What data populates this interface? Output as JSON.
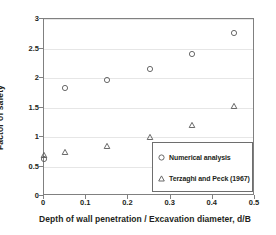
{
  "chart_data": {
    "type": "scatter",
    "title": "",
    "xlabel": "Depth of wall penetration / Excavation diameter, d/B",
    "ylabel": "Factor of safety",
    "xlim": [
      0,
      0.5
    ],
    "ylim": [
      0,
      3
    ],
    "xticks": [
      "0",
      "0.1",
      "0.2",
      "0.3",
      "0.4",
      "0.5"
    ],
    "xtick_values": [
      0,
      0.1,
      0.2,
      0.3,
      0.4,
      0.5
    ],
    "yticks": [
      "0",
      "0.5",
      "1",
      "1.5",
      "2",
      "2.5",
      "3"
    ],
    "ytick_values": [
      0,
      0.5,
      1,
      1.5,
      2,
      2.5,
      3
    ],
    "grid": "horizontal",
    "legend_position": "lower-right",
    "x": [
      0,
      0.05,
      0.15,
      0.25,
      0.35,
      0.45
    ],
    "series": [
      {
        "name": "Numerical analysis",
        "marker": "circle",
        "color": "#595959",
        "values": [
          0.62,
          1.83,
          1.97,
          2.16,
          2.4,
          2.77
        ]
      },
      {
        "name": "Terzaghi and Peck (1967)",
        "marker": "triangle",
        "color": "#595959",
        "values": [
          0.7,
          0.75,
          0.85,
          1.0,
          1.21,
          1.53
        ]
      }
    ]
  },
  "legend": {
    "entries": [
      {
        "label": "Numerical analysis",
        "marker": "circle-marker-icon"
      },
      {
        "label": "Terzaghi and Peck (1967)",
        "marker": "triangle-marker-icon"
      }
    ]
  },
  "colors": {
    "axis": "#808080",
    "grid": "#e6e6e6",
    "marker": "#595959",
    "text": "#231f20",
    "background": "#ffffff"
  }
}
